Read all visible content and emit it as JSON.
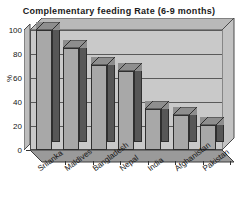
{
  "chart_data": {
    "type": "bar",
    "title": "Complementary feeding Rate (6-9 months)",
    "xlabel": "",
    "ylabel": "%",
    "ylim": [
      0,
      100
    ],
    "yticks": [
      0,
      20,
      40,
      60,
      80,
      100
    ],
    "grid": true,
    "legend": "none",
    "style": "3d-column",
    "categories": [
      "Srilanka",
      "Maldives",
      "Bangladesh",
      "Nepal",
      "India",
      "Afghanistan",
      "Pakistan"
    ],
    "values": [
      100,
      85,
      71,
      66,
      34,
      29,
      21
    ],
    "colors": {
      "bar_face": "#a8a8a8",
      "bar_side": "#575757",
      "bar_top": "#8e8e8e",
      "plot_background": "#c9c9c9",
      "gridline": "#5a5a5a",
      "axis": "#333333",
      "text": "#151515",
      "page_background": "#ffffff"
    }
  }
}
